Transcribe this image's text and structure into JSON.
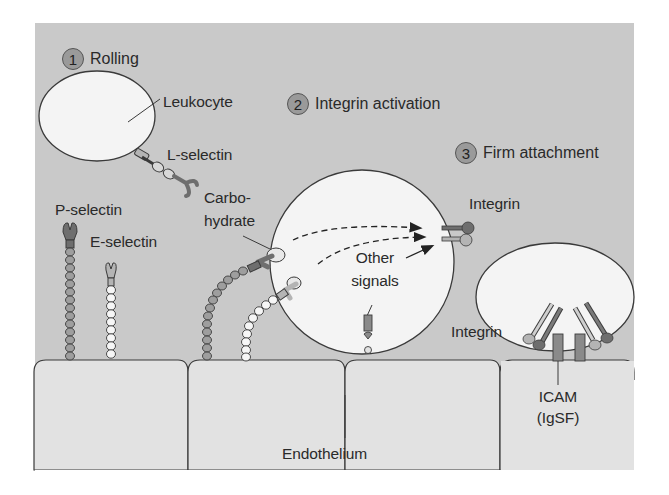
{
  "diagram": {
    "colors": {
      "panel_background": "#c9c9c9",
      "endothelium_fill": "#e2e2e2",
      "cell_fill": "#f4f4f4",
      "outline": "#3a3a3a",
      "step_badge": "#9a9a9a",
      "dark_protein": "#6e6e6e",
      "light_protein": "#b4b4b4"
    },
    "steps": [
      {
        "number": "1",
        "label": "Rolling"
      },
      {
        "number": "2",
        "label": "Integrin activation"
      },
      {
        "number": "3",
        "label": "Firm attachment"
      }
    ],
    "labels": {
      "leukocyte": "Leukocyte",
      "l_selectin": "L-selectin",
      "p_selectin": "P-selectin",
      "e_selectin": "E-selectin",
      "carbohydrate_line1": "Carbo-",
      "carbohydrate_line2": "hydrate",
      "integrin_upper": "Integrin",
      "other_signals_line1": "Other",
      "other_signals_line2": "signals",
      "integrin_lower": "Integrin",
      "icam_line1": "ICAM",
      "icam_line2": "(IgSF)",
      "endothelium": "Endothelium"
    }
  }
}
